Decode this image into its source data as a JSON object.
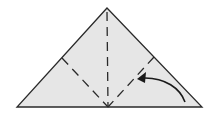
{
  "diagram": {
    "type": "origami-fold-step",
    "paper_color": "#e6e6e6",
    "line_color": "#2a2a2a",
    "shape": "triangle",
    "fold_lines": [
      "center-vertical-valley",
      "left-diagonal-valley",
      "right-diagonal-valley"
    ],
    "arrow": "fold-right-corner-up"
  }
}
